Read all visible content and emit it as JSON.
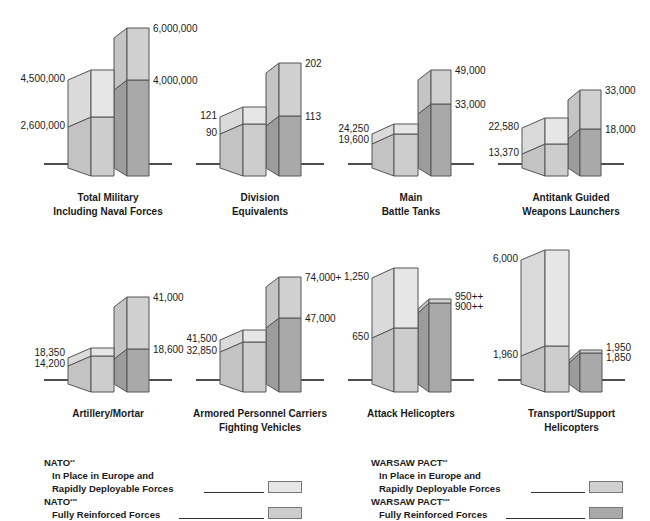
{
  "colors": {
    "nato_in_place": "#e6e6e6",
    "nato_in_place_side": "#dadada",
    "nato_full": "#cdcdcd",
    "nato_full_side": "#c3c3c3",
    "warsaw_in_place": "#d0d0d0",
    "warsaw_in_place_side": "#c4c4c4",
    "warsaw_full": "#a9a9a9",
    "warsaw_full_side": "#9c9c9c",
    "outline": "#555555",
    "baseline": "#222222"
  },
  "chart_data": {
    "type": "bar",
    "subtype": "3d-stacked-paired-bars",
    "layout": "2 rows x 4 small-multiple panels, each with independent scale",
    "legend_position": "bottom",
    "grid": false,
    "series": [
      {
        "name": "NATO In Place in Europe and Rapidly Deployable Forces"
      },
      {
        "name": "NATO Fully Reinforced Forces"
      },
      {
        "name": "WARSAW PACT In Place in Europe and Rapidly Deployable Forces"
      },
      {
        "name": "WARSAW PACT Fully Reinforced Forces"
      }
    ],
    "panels": [
      {
        "title": [
          "Total Military",
          "Including Naval Forces"
        ],
        "nato": {
          "in_place": 2600000,
          "full": 4500000,
          "in_place_label": "2,600,000",
          "full_label": "4,500,000"
        },
        "warsaw": {
          "in_place": 4000000,
          "full": 6000000,
          "in_place_label": "4,000,000",
          "full_label": "6,000,000"
        }
      },
      {
        "title": [
          "Division",
          "Equivalents"
        ],
        "nato": {
          "in_place": 90,
          "full": 121,
          "in_place_label": "90",
          "full_label": "121"
        },
        "warsaw": {
          "in_place": 113,
          "full": 202,
          "in_place_label": "113",
          "full_label": "202"
        }
      },
      {
        "title": [
          "Main",
          "Battle Tanks"
        ],
        "nato": {
          "in_place": 19600,
          "full": 24250,
          "in_place_label": "19,600",
          "full_label": "24,250"
        },
        "warsaw": {
          "in_place": 33000,
          "full": 49000,
          "in_place_label": "33,000",
          "full_label": "49,000"
        }
      },
      {
        "title": [
          "Antitank Guided",
          "Weapons Launchers"
        ],
        "nato": {
          "in_place": 13370,
          "full": 22580,
          "in_place_label": "13,370",
          "full_label": "22,580"
        },
        "warsaw": {
          "in_place": 18000,
          "full": 33000,
          "in_place_label": "18,000",
          "full_label": "33,000"
        }
      },
      {
        "title": [
          "Artillery/Mortar"
        ],
        "nato": {
          "in_place": 14200,
          "full": 18350,
          "in_place_label": "14,200",
          "full_label": "18,350"
        },
        "warsaw": {
          "in_place": 18600,
          "full": 41000,
          "in_place_label": "18,600",
          "full_label": "41,000"
        }
      },
      {
        "title": [
          "Armored Personnel Carriers",
          "Fighting Vehicles"
        ],
        "nato": {
          "in_place": 32850,
          "full": 41500,
          "in_place_label": "32,850",
          "full_label": "41,500"
        },
        "warsaw": {
          "in_place": 47000,
          "full": 74000,
          "in_place_label": "47,000",
          "full_label": "74,000+"
        }
      },
      {
        "title": [
          "Attack Helicopters"
        ],
        "nato": {
          "in_place": 650,
          "full": 1250,
          "in_place_label": "650",
          "full_label": "1,250"
        },
        "warsaw": {
          "in_place": 900,
          "full": 950,
          "in_place_label": "900++",
          "full_label": "950++"
        }
      },
      {
        "title": [
          "Transport/Support",
          "Helicopters"
        ],
        "nato": {
          "in_place": 1960,
          "full": 6000,
          "in_place_label": "1,960",
          "full_label": "6,000"
        },
        "warsaw": {
          "in_place": 1850,
          "full": 1950,
          "in_place_label": "1,850",
          "full_label": "1,950"
        }
      }
    ]
  },
  "geometry": {
    "panels": [
      {
        "x0": 44,
        "base": 164,
        "nsx": 68,
        "nfx": 91,
        "nex": 114,
        "wfx": 127,
        "wex": 149,
        "ntop": 70,
        "nmid": 117,
        "wtop": 28,
        "wmid": 80,
        "lx1": 148,
        "lx2": 172
      },
      {
        "x0": 196,
        "base": 164,
        "nsx": 220,
        "nfx": 243,
        "nex": 266,
        "wfx": 279,
        "wex": 301,
        "ntop": 107,
        "nmid": 124,
        "wtop": 63,
        "wmid": 116,
        "lx1": 300,
        "lx2": 324
      },
      {
        "x0": 348,
        "base": 164,
        "nsx": 372,
        "nfx": 394,
        "nex": 418,
        "wfx": 431,
        "wex": 451,
        "ntop": 124,
        "nmid": 134,
        "wtop": 70,
        "wmid": 104,
        "lx1": 450,
        "lx2": 474
      },
      {
        "x0": 498,
        "base": 164,
        "nsx": 522,
        "nfx": 545,
        "nex": 568,
        "wfx": 580,
        "wex": 601,
        "ntop": 118,
        "nmid": 144,
        "wtop": 90,
        "wmid": 129,
        "lx1": 600,
        "lx2": 624
      },
      {
        "x0": 44,
        "base": 380,
        "nsx": 68,
        "nfx": 91,
        "nex": 114,
        "wfx": 127,
        "wex": 149,
        "ntop": 348,
        "nmid": 356,
        "wtop": 297,
        "wmid": 349,
        "lx1": 148,
        "lx2": 172
      },
      {
        "x0": 196,
        "base": 380,
        "nsx": 220,
        "nfx": 243,
        "nex": 266,
        "wfx": 279,
        "wex": 301,
        "ntop": 330,
        "nmid": 342,
        "wtop": 277,
        "wmid": 318,
        "lx1": 300,
        "lx2": 324
      },
      {
        "x0": 348,
        "base": 380,
        "nsx": 372,
        "nfx": 394,
        "nex": 418,
        "wfx": 429,
        "wex": 451,
        "ntop": 268,
        "nmid": 328,
        "wtop": 299,
        "wmid": 303,
        "lx1": 450,
        "lx2": 474
      },
      {
        "x0": 498,
        "base": 380,
        "nsx": 521,
        "nfx": 545,
        "nex": 569,
        "wfx": 580,
        "wex": 602,
        "ntop": 250,
        "nmid": 346,
        "wtop": 350,
        "wmid": 353,
        "lx1": 601,
        "lx2": 625
      }
    ],
    "bottom_offset": 12,
    "side_slope": 10
  },
  "legend": {
    "nato": {
      "header1": "NATO",
      "header1_mark": "**",
      "line1": "In Place in Europe and",
      "line2": "Rapidly Deployable Forces",
      "header2": "NATO",
      "header2_mark": "***",
      "line3": "Fully Reinforced Forces"
    },
    "warsaw": {
      "header1": "WARSAW PACT",
      "header1_mark": "**",
      "line1": "In Place in Europe and",
      "line2": "Rapidly Deployable Forces",
      "header2": "WARSAW PACT",
      "header2_mark": "***",
      "line3": "Fully Reinforced Forces"
    }
  }
}
